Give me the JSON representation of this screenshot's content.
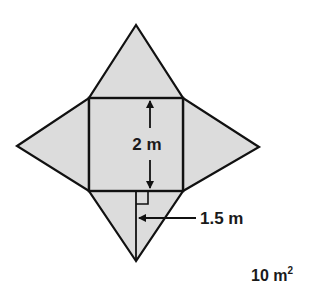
{
  "figure": {
    "fill_color": "#dcdcdc",
    "stroke_color": "#111111",
    "base": {
      "shape": "square",
      "side_label": "2 m"
    },
    "faces": [
      {
        "name": "top-triangle"
      },
      {
        "name": "left-triangle"
      },
      {
        "name": "right-triangle"
      },
      {
        "name": "bottom-triangle"
      }
    ],
    "slant_height_label": "1.5 m",
    "answer_label": "10 m",
    "answer_superscript": "2"
  }
}
